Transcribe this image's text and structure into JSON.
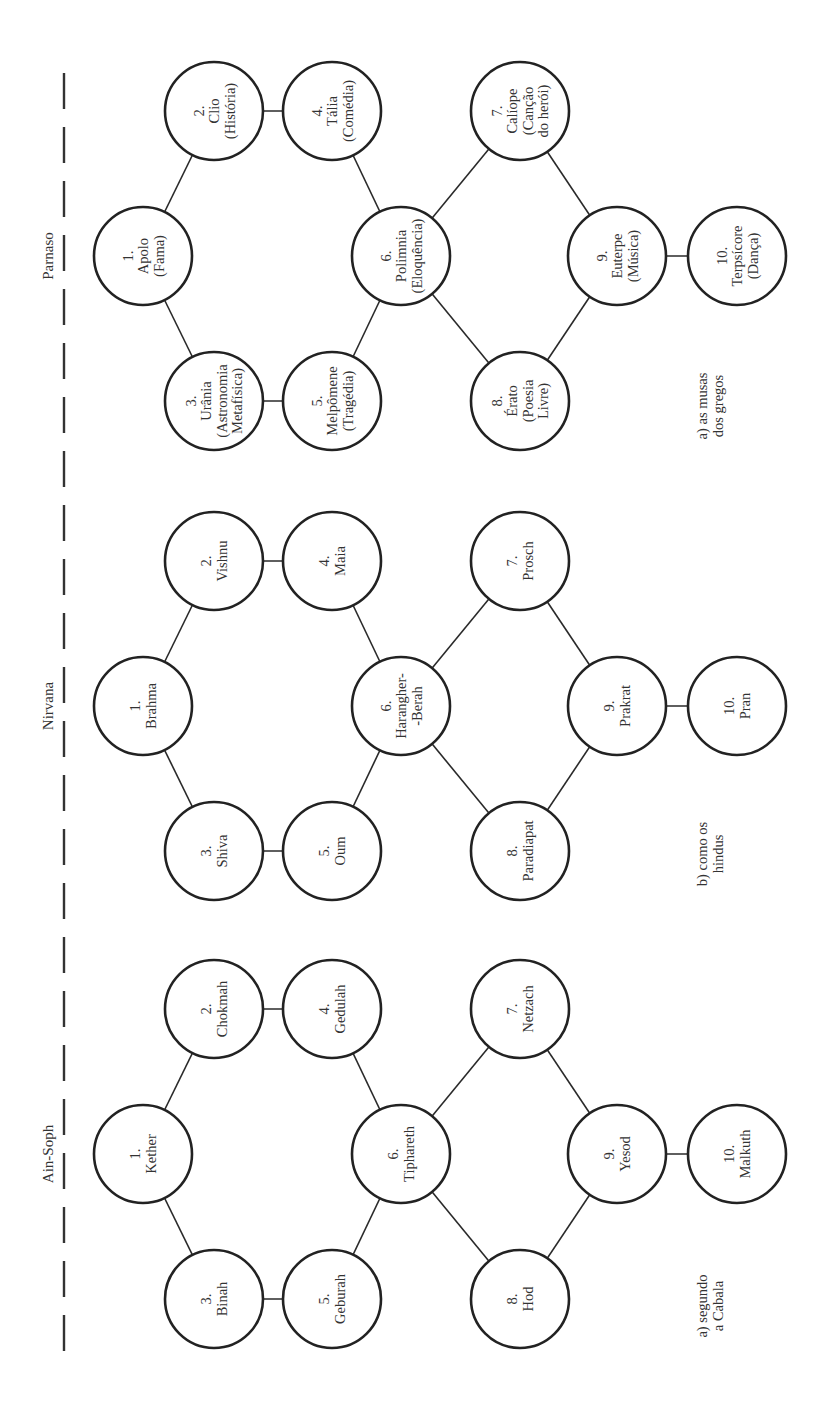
{
  "figure": {
    "orientation": "rotated-90-ccw",
    "colors": {
      "line": "#222222",
      "text": "#333333",
      "background": "#ffffff"
    }
  },
  "sections": [
    {
      "id": "parnaso",
      "header": "Parnaso",
      "caption": [
        "a) as musas",
        "dos gregos"
      ],
      "center_y": 256,
      "nodes": [
        {
          "n": "1.",
          "lines": [
            "Apolo",
            "(Fama)"
          ]
        },
        {
          "n": "2.",
          "lines": [
            "Clio",
            "(História)"
          ]
        },
        {
          "n": "3.",
          "lines": [
            "Urânia",
            "(Astronomia",
            "Metafísica)"
          ]
        },
        {
          "n": "4.",
          "lines": [
            "Tália",
            "(Comédia)"
          ]
        },
        {
          "n": "5.",
          "lines": [
            "Melpômene",
            "(Tragédia)"
          ]
        },
        {
          "n": "6.",
          "lines": [
            "Polimnia",
            "(Eloquência)"
          ]
        },
        {
          "n": "7.",
          "lines": [
            "Calíope",
            "(Canção",
            "do herói)"
          ]
        },
        {
          "n": "8.",
          "lines": [
            "Érato",
            "(Poesia",
            "Livre)"
          ]
        },
        {
          "n": "9.",
          "lines": [
            "Euterpe",
            "(Música)"
          ]
        },
        {
          "n": "10.",
          "lines": [
            "Terpsícore",
            "(Dança)"
          ]
        }
      ]
    },
    {
      "id": "nirvana",
      "header": "Nirvana",
      "caption": [
        "b) como os",
        "hindus"
      ],
      "center_y": 706,
      "nodes": [
        {
          "n": "1.",
          "lines": [
            "Brahma"
          ]
        },
        {
          "n": "2.",
          "lines": [
            "Vishnu"
          ]
        },
        {
          "n": "3.",
          "lines": [
            "Shiva"
          ]
        },
        {
          "n": "4.",
          "lines": [
            "Maia"
          ]
        },
        {
          "n": "5.",
          "lines": [
            "Oum"
          ]
        },
        {
          "n": "6.",
          "lines": [
            "Harangher-",
            "-Berah"
          ]
        },
        {
          "n": "7.",
          "lines": [
            "Prosch"
          ]
        },
        {
          "n": "8.",
          "lines": [
            "Paradiapat"
          ]
        },
        {
          "n": "9.",
          "lines": [
            "Prakrat"
          ]
        },
        {
          "n": "10.",
          "lines": [
            "Pran"
          ]
        }
      ]
    },
    {
      "id": "ain-soph",
      "header": "Ain-Soph",
      "caption": [
        "a) segundo",
        "a Cabala"
      ],
      "center_y": 1154,
      "nodes": [
        {
          "n": "1.",
          "lines": [
            "Kether"
          ]
        },
        {
          "n": "2.",
          "lines": [
            "Chokmah"
          ]
        },
        {
          "n": "3.",
          "lines": [
            "Binah"
          ]
        },
        {
          "n": "4.",
          "lines": [
            "Gedulah"
          ]
        },
        {
          "n": "5.",
          "lines": [
            "Geburah"
          ]
        },
        {
          "n": "6.",
          "lines": [
            "Tiphareth"
          ]
        },
        {
          "n": "7.",
          "lines": [
            "Netzach"
          ]
        },
        {
          "n": "8.",
          "lines": [
            "Hod"
          ]
        },
        {
          "n": "9.",
          "lines": [
            "Yesod"
          ]
        },
        {
          "n": "10.",
          "lines": [
            "Malkuth"
          ]
        }
      ]
    }
  ],
  "layout": {
    "node_radius": 49,
    "node_offsets": [
      [
        143,
        0
      ],
      [
        214,
        -145
      ],
      [
        214,
        145
      ],
      [
        332,
        -145
      ],
      [
        332,
        145
      ],
      [
        401,
        0
      ],
      [
        520,
        -145
      ],
      [
        520,
        145
      ],
      [
        617,
        0
      ],
      [
        737,
        0
      ]
    ],
    "edges": [
      [
        0,
        1
      ],
      [
        0,
        2
      ],
      [
        1,
        3
      ],
      [
        2,
        4
      ],
      [
        3,
        5
      ],
      [
        4,
        5
      ],
      [
        5,
        6
      ],
      [
        5,
        7
      ],
      [
        6,
        8
      ],
      [
        7,
        8
      ],
      [
        8,
        9
      ]
    ],
    "divider": {
      "x": 64,
      "y1": 73,
      "y2": 1352
    },
    "header_x": 48,
    "caption_x": 710,
    "caption_dy": [
      150,
      148,
      152
    ]
  }
}
